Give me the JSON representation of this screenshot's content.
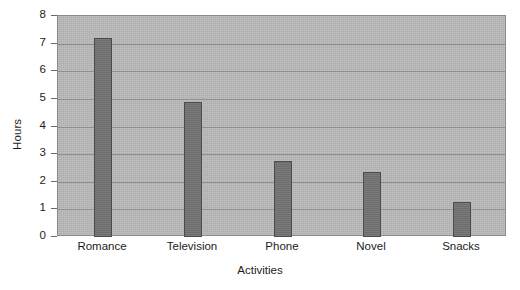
{
  "chart_data": {
    "type": "bar",
    "title": "",
    "xlabel": "Activities",
    "ylabel": "Hours",
    "categories": [
      "Romance",
      "Television",
      "Phone",
      "Novel",
      "Snacks"
    ],
    "values": [
      7.2,
      4.9,
      2.75,
      2.35,
      1.25
    ],
    "ylim": [
      0,
      8
    ],
    "ytick_labels": [
      "8",
      "7",
      "6",
      "5",
      "4",
      "3",
      "2",
      "1",
      "0"
    ],
    "ytick_values": [
      8,
      7,
      6,
      5,
      4,
      3,
      2,
      1,
      0
    ],
    "grid": true,
    "legend": null,
    "colors": {
      "bar_fill": "#737373",
      "bar_border": "#4c4c4c",
      "plot_background": "#b9b9b9",
      "plot_border": "#8a8a8a",
      "gridline": "#8f8f8f",
      "page_background": "#ffffff",
      "text": "#1c1c1c"
    }
  }
}
